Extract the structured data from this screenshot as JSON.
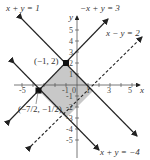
{
  "graph": {
    "axes": {
      "x_label": "x",
      "y_label": "y",
      "x_ticks": [
        "-5",
        "-1",
        "0",
        "1",
        "3",
        "5"
      ],
      "y_ticks": [
        "5",
        "4",
        "3",
        "2",
        "1",
        "-1",
        "-2",
        "-3",
        "-4",
        "-5"
      ]
    },
    "lines": [
      {
        "label": "x + y = 1",
        "style": "solid"
      },
      {
        "label": "−x + y = 3",
        "style": "solid"
      },
      {
        "label": "x − y = 2",
        "style": "dashed"
      },
      {
        "label": "x + y = −4",
        "style": "solid"
      }
    ],
    "points": [
      {
        "label": "(−1, 2)"
      },
      {
        "label": "(−7/2, −1/2)"
      }
    ],
    "colors": {
      "shade": "#c8c8c8",
      "line": "#222222"
    }
  }
}
